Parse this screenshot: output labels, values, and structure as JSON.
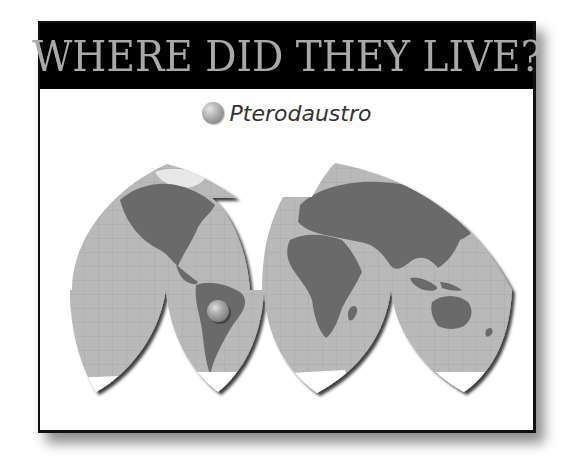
{
  "header": {
    "title": "WHERE DID THEY LIVE?"
  },
  "legend": {
    "marker_icon": "sphere-marker-icon",
    "label": "Pterodaustro"
  },
  "map": {
    "projection": "interrupted-homolosine",
    "colors": {
      "ocean": "#b9b9b9",
      "land": "#6b6b6b",
      "ice": "#ffffff",
      "graticule": "#a2a2a2",
      "marker": "#9a9a9a"
    },
    "markers": [
      {
        "name": "Pterodaustro",
        "region": "South America (Argentina)",
        "x": 218,
        "y": 311,
        "r": 11
      }
    ]
  }
}
